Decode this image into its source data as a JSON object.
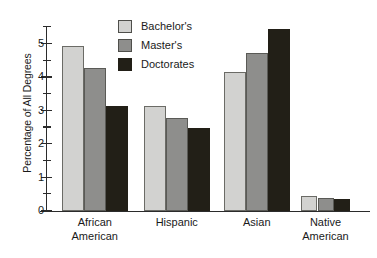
{
  "chart_data": {
    "type": "bar",
    "title": "",
    "subtitle": "",
    "xlabel": "",
    "ylabel": "Percentage of All Degrees",
    "ylim": [
      0,
      5.6
    ],
    "ytick_labels": [
      "0",
      "1",
      "2",
      "3",
      "4",
      "5"
    ],
    "ytick_values": [
      0,
      1,
      2,
      3,
      4,
      5
    ],
    "yminor_values": [
      0.5,
      1.5,
      2.5,
      3.5,
      4.5,
      5.5
    ],
    "grid": false,
    "legend_position": "top-center",
    "categories": [
      "African American",
      "Hispanic",
      "Asian",
      "Native American"
    ],
    "series": [
      {
        "name": "Bachelor's",
        "color": "#d2d2d0",
        "values": [
          4.93,
          3.15,
          4.17,
          0.45
        ]
      },
      {
        "name": "Master's",
        "color": "#8e8e8c",
        "values": [
          4.28,
          2.78,
          4.72,
          0.4
        ]
      },
      {
        "name": "Doctorates",
        "color": "#221f17",
        "values": [
          3.15,
          2.47,
          5.45,
          0.35
        ]
      }
    ]
  },
  "axis": {
    "y_title": "Percentage of All Degrees",
    "ticks": [
      {
        "label": "5",
        "value": 5
      },
      {
        "label": "4",
        "value": 4
      },
      {
        "label": "3",
        "value": 3
      },
      {
        "label": "2",
        "value": 2
      },
      {
        "label": "1",
        "value": 1
      },
      {
        "label": "0",
        "value": 0
      }
    ]
  },
  "categories": [
    {
      "line1": "African",
      "line2": "American"
    },
    {
      "line1": "Hispanic",
      "line2": ""
    },
    {
      "line1": "Asian",
      "line2": ""
    },
    {
      "line1": "Native",
      "line2": "American"
    }
  ],
  "legend": {
    "items": [
      {
        "label": "Bachelor's",
        "color": "#d2d2d0"
      },
      {
        "label": "Master's",
        "color": "#8e8e8c"
      },
      {
        "label": "Doctorates",
        "color": "#221f17"
      }
    ]
  }
}
